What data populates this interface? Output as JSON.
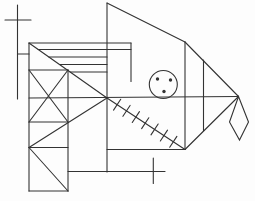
{
  "canvas": {
    "width": 255,
    "height": 201,
    "background": "#fdfdfd",
    "stroke_color": "#333333",
    "stroke_width": 1.1
  },
  "drawing": {
    "lines": [
      {
        "name": "dimension-left-vertical",
        "pts": [
          17.5,
          5,
          17.5,
          99
        ]
      },
      {
        "name": "dimension-left-tick",
        "pts": [
          5,
          20,
          31,
          20
        ]
      },
      {
        "name": "dimension-left-stub",
        "pts": [
          17.5,
          54,
          29,
          54
        ]
      },
      {
        "name": "mouth-bottom-horizontal",
        "pts": [
          68,
          171.5,
          165,
          171.5
        ]
      },
      {
        "name": "dimension-bottom-tick",
        "pts": [
          153.3,
          158,
          153.3,
          183.5
        ]
      },
      {
        "name": "center-vertical",
        "pts": [
          107,
          3,
          107,
          172
        ]
      },
      {
        "name": "peak-diagonal",
        "pts": [
          107,
          3,
          185,
          42
        ]
      },
      {
        "name": "top-edge",
        "pts": [
          29,
          43,
          131,
          43
        ]
      },
      {
        "name": "inner-vertical-x131",
        "pts": [
          131,
          43,
          131,
          81.5
        ]
      },
      {
        "name": "left-edge",
        "pts": [
          29,
          43,
          29,
          191
        ]
      },
      {
        "name": "body-diagonal-topleft",
        "pts": [
          29,
          43,
          107,
          98
        ]
      },
      {
        "name": "mid-horizontal",
        "pts": [
          29,
          98,
          238.5,
          96.5
        ]
      },
      {
        "name": "right-vertical-x185",
        "pts": [
          185,
          42,
          185,
          149.5
        ]
      },
      {
        "name": "head-top-diagonal",
        "pts": [
          185,
          42,
          238.5,
          96.5
        ]
      },
      {
        "name": "head-inner-vertical",
        "pts": [
          203.5,
          60,
          203.5,
          130.5
        ]
      },
      {
        "name": "head-bottom-diagonal",
        "pts": [
          238.5,
          96.5,
          185,
          149.5
        ]
      },
      {
        "name": "gill-diagonal",
        "pts": [
          107,
          98,
          185,
          149.5
        ]
      },
      {
        "name": "gill-bottom-horizontal",
        "pts": [
          107,
          149.5,
          185,
          149.5
        ]
      },
      {
        "name": "body-diagonal-bottomleft",
        "pts": [
          107,
          98,
          29,
          147.5
        ]
      },
      {
        "name": "xbox-top",
        "pts": [
          29,
          70,
          68,
          70
        ]
      },
      {
        "name": "xbox-bottom",
        "pts": [
          29,
          122,
          68,
          122
        ]
      },
      {
        "name": "inner-vertical-x68",
        "pts": [
          68,
          70,
          68,
          191
        ]
      },
      {
        "name": "xbox-diagonal-a",
        "pts": [
          29,
          70,
          68,
          122
        ]
      },
      {
        "name": "xbox-diagonal-b",
        "pts": [
          68,
          70,
          29,
          122
        ]
      },
      {
        "name": "lower-square-top",
        "pts": [
          29,
          147.5,
          68,
          147.5
        ]
      },
      {
        "name": "lower-square-bottom",
        "pts": [
          29,
          191,
          68,
          191
        ]
      },
      {
        "name": "lower-square-diagonal",
        "pts": [
          29,
          147.5,
          68,
          191
        ]
      },
      {
        "name": "shelf-line-1",
        "pts": [
          38.2,
          49.5,
          131,
          49.5
        ]
      },
      {
        "name": "shelf-line-2",
        "pts": [
          48.9,
          57,
          107,
          57
        ]
      },
      {
        "name": "shelf-line-3",
        "pts": [
          59.5,
          64.5,
          107,
          64.5
        ]
      },
      {
        "name": "shelf-line-4",
        "pts": [
          70.1,
          72,
          107,
          72
        ]
      }
    ],
    "kite": {
      "name": "tail-kite",
      "points": [
        [
          238.5,
          96.5
        ],
        [
          248.5,
          122
        ],
        [
          239.5,
          140
        ],
        [
          229.5,
          122
        ]
      ]
    },
    "eye": {
      "name": "eye-circle",
      "cx": 163.3,
      "cy": 84.5,
      "r": 14,
      "dots": [
        {
          "cx": 157.5,
          "cy": 79,
          "r": 1.7
        },
        {
          "cx": 170.5,
          "cy": 80,
          "r": 1.7
        },
        {
          "cx": 164,
          "cy": 91.5,
          "r": 1.7
        }
      ]
    },
    "hatch": {
      "name": "gill-hatch-ticks",
      "along": [
        107,
        98,
        185,
        149.5
      ],
      "count": 7,
      "t_start": 0.13,
      "t_end": 0.85,
      "half_length": 6.5
    }
  }
}
